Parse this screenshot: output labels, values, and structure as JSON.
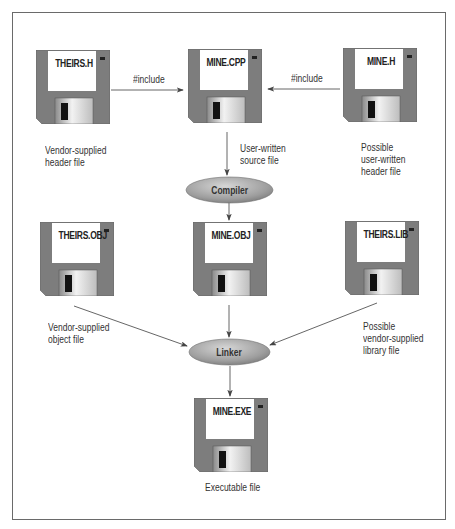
{
  "diagram": {
    "colors": {
      "frame": "#6a6a6a",
      "disk_body": "#7d7d7d",
      "disk_label_area": "#ffffff",
      "disk_shutter": "#c8c8c8",
      "disk_window": "#1a1a1a",
      "ellipse_fill": "#9a9a9a",
      "arrow": "#444444"
    },
    "files": {
      "theirs_h": {
        "name": "THEIRS.H",
        "caption": [
          "Vendor-supplied",
          "header file"
        ],
        "icon": "floppy-disk-icon"
      },
      "mine_cpp": {
        "name": "MINE.CPP",
        "caption": [
          "User-written",
          "source file"
        ],
        "icon": "floppy-disk-icon"
      },
      "mine_h": {
        "name": "MINE.H",
        "caption": [
          "Possible",
          "user-written",
          "header file"
        ],
        "icon": "floppy-disk-icon"
      },
      "theirs_obj": {
        "name": "THEIRS.OBJ",
        "caption": [
          "Vendor-supplied",
          "object file"
        ],
        "icon": "floppy-disk-icon"
      },
      "mine_obj": {
        "name": "MINE.OBJ",
        "caption": [],
        "icon": "floppy-disk-icon"
      },
      "theirs_lib": {
        "name": "THEIRS.LIB",
        "caption": [
          "Possible",
          "vendor-supplied",
          "library file"
        ],
        "icon": "floppy-disk-icon"
      },
      "mine_exe": {
        "name": "MINE.EXE",
        "caption": [
          "Executable file"
        ],
        "icon": "floppy-disk-icon"
      }
    },
    "processes": {
      "compiler": {
        "label": "Compiler"
      },
      "linker": {
        "label": "Linker"
      }
    },
    "edges": {
      "theirs_h_to_cpp": {
        "label": "#include"
      },
      "mine_h_to_cpp": {
        "label": "#include"
      }
    }
  }
}
